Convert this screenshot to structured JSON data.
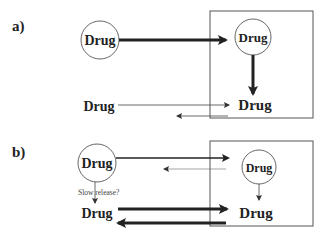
{
  "panels": [
    {
      "label": "a)",
      "drug_outside_circle": "Drug",
      "drug_inside_circle": "Drug",
      "drug_outside_free": "Drug",
      "drug_inside_free": "Drug"
    },
    {
      "label": "b)",
      "drug_outside_circle": "Drug",
      "drug_inside_circle": "Drug",
      "drug_outside_free": "Drug",
      "drug_inside_free": "Drug",
      "annotation": "Slow release?"
    }
  ],
  "colors": {
    "stroke": "#222222",
    "box": "#555555",
    "circle": "#666666",
    "background": "#ffffff"
  }
}
